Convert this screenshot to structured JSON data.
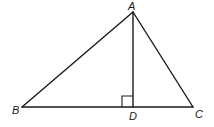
{
  "diagram": {
    "type": "geometry-triangle",
    "points": {
      "A": {
        "label": "A",
        "x": 133,
        "y": 12,
        "label_x": 128,
        "label_y": 10
      },
      "B": {
        "label": "B",
        "x": 22,
        "y": 107,
        "label_x": 12,
        "label_y": 114
      },
      "C": {
        "label": "C",
        "x": 193,
        "y": 107,
        "label_x": 195,
        "label_y": 118
      },
      "D": {
        "label": "D",
        "x": 133,
        "y": 107,
        "label_x": 129,
        "label_y": 120
      }
    },
    "segments": [
      "AB",
      "AC",
      "BC",
      "AD"
    ],
    "right_angle": {
      "at": "D",
      "between": [
        "A",
        "B"
      ],
      "size": 11
    },
    "stroke_color": "#1a1a1a",
    "background": "#ffffff"
  }
}
